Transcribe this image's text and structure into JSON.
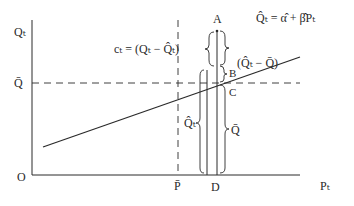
{
  "diagram": {
    "axes": {
      "y_label": "Qₜ",
      "x_label": "Pₜ",
      "origin_label": "O",
      "y_mean_label": "Q̄",
      "x_mean_label": "P̄",
      "x_point_label": "D"
    },
    "regression_line": {
      "equation": "Q̂ₜ = α̂ + β̂Pₜ"
    },
    "points": {
      "A": "A",
      "B": "B",
      "C": "C",
      "D": "D"
    },
    "annotations": {
      "residual": "cₜ = (Qₜ − Q̂ₜ)",
      "deviation_fit": "(Q̂ₜ − Q̄)",
      "fitted": "Q̂ₜ",
      "mean": "Q̄"
    },
    "colors": {
      "ink": "#2a2a2a",
      "background": "#ffffff"
    }
  }
}
